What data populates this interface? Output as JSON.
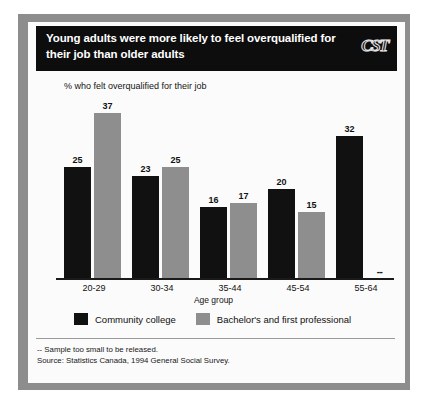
{
  "header": {
    "title": "Young adults were more likely to feel overqualified for their job than older adults",
    "logo": "CST"
  },
  "footer": {
    "note": "-- Sample too small to be released.",
    "source": "Source: Statistics Canada, 1994 General Social Survey."
  },
  "chart_data": {
    "type": "bar",
    "title": "% who felt overqualified for their job",
    "xlabel": "Age group",
    "ylabel": "",
    "ylim": [
      0,
      40
    ],
    "grid": false,
    "legend_position": "bottom",
    "categories": [
      "20-29",
      "30-34",
      "35-44",
      "45-54",
      "55-64"
    ],
    "series": [
      {
        "name": "Community college",
        "color": "#111111",
        "values": [
          25,
          23,
          16,
          20,
          32
        ],
        "labels": [
          "25",
          "23",
          "16",
          "20",
          "32"
        ]
      },
      {
        "name": "Bachelor's and first professional",
        "color": "#8e8e8e",
        "values": [
          37,
          25,
          17,
          15,
          null
        ],
        "labels": [
          "37",
          "25",
          "17",
          "15",
          "--"
        ]
      }
    ],
    "suppressed_marker": "--"
  }
}
